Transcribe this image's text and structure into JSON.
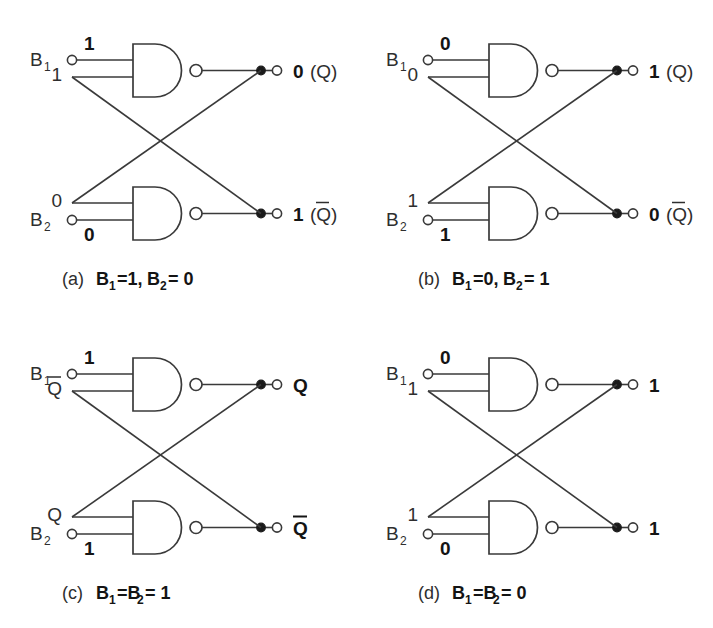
{
  "figure": {
    "background_color": "#ffffff",
    "line_color": "#3a3a3a",
    "text_color": "#2e2e2e",
    "bold_text_color": "#141414"
  },
  "panels": [
    {
      "id": "panel-a",
      "caption_paren": "(a)",
      "caption_text": "B",
      "caption_sub_1": "1",
      "caption_mid": "=1,",
      "caption_text2": "B",
      "caption_sub_2": "2",
      "caption_end": "= 0",
      "caption_full": "(a) B1=1, B2=0",
      "upper": {
        "input_terminal_label": "B",
        "input_terminal_sub": "1",
        "input_value": "1",
        "input_value_bold": true,
        "feedback_value": "1",
        "feedback_value_bold": false,
        "output_value": "0",
        "output_name": "(Q)",
        "output_has_overline": false
      },
      "lower": {
        "input_terminal_label": "B",
        "input_terminal_sub": "2",
        "input_value": "0",
        "input_value_bold": true,
        "feedback_value": "0",
        "feedback_value_bold": false,
        "output_value": "1",
        "output_name": "(Q)",
        "output_has_overline": true
      }
    },
    {
      "id": "panel-b",
      "caption_paren": "(b)",
      "caption_text": "B",
      "caption_sub_1": "1",
      "caption_mid": "=0,",
      "caption_text2": "B",
      "caption_sub_2": "2",
      "caption_end": "= 1",
      "caption_full": "(b) B1=0, B2=1",
      "upper": {
        "input_terminal_label": "B",
        "input_terminal_sub": "1",
        "input_value": "0",
        "input_value_bold": true,
        "feedback_value": "0",
        "feedback_value_bold": false,
        "output_value": "1",
        "output_name": "(Q)",
        "output_has_overline": false
      },
      "lower": {
        "input_terminal_label": "B",
        "input_terminal_sub": "2",
        "input_value": "1",
        "input_value_bold": true,
        "feedback_value": "1",
        "feedback_value_bold": false,
        "output_value": "0",
        "output_name": "(Q)",
        "output_has_overline": true
      }
    },
    {
      "id": "panel-c",
      "caption_paren": "(c)",
      "caption_text": "B",
      "caption_sub_1": "1",
      "caption_mid": "=B",
      "caption_text2": "",
      "caption_sub_2": "2",
      "caption_end": "= 1",
      "caption_full": "(c) B1=B2=1",
      "upper": {
        "input_terminal_label": "B",
        "input_terminal_sub": "1",
        "input_value": "1",
        "input_value_bold": true,
        "feedback_value": "Q",
        "feedback_value_bold": false,
        "feedback_has_overline": true,
        "output_value": "Q",
        "output_name": "",
        "output_has_overline": false,
        "output_bold": true
      },
      "lower": {
        "input_terminal_label": "B",
        "input_terminal_sub": "2",
        "input_value": "1",
        "input_value_bold": true,
        "feedback_value": "Q",
        "feedback_value_bold": false,
        "feedback_has_overline": false,
        "output_value": "Q",
        "output_name": "",
        "output_has_overline": true,
        "output_bold": true
      }
    },
    {
      "id": "panel-d",
      "caption_paren": "(d)",
      "caption_text": "B",
      "caption_sub_1": "1",
      "caption_mid": "=B",
      "caption_text2": "",
      "caption_sub_2": "2",
      "caption_end": "= 0",
      "caption_full": "(d) B1=B2=0",
      "upper": {
        "input_terminal_label": "B",
        "input_terminal_sub": "1",
        "input_value": "0",
        "input_value_bold": true,
        "feedback_value": "1",
        "feedback_value_bold": false,
        "output_value": "1",
        "output_name": "",
        "output_has_overline": false
      },
      "lower": {
        "input_terminal_label": "B",
        "input_terminal_sub": "2",
        "input_value": "0",
        "input_value_bold": true,
        "feedback_value": "1",
        "feedback_value_bold": false,
        "output_value": "1",
        "output_name": "",
        "output_has_overline": false
      }
    }
  ]
}
